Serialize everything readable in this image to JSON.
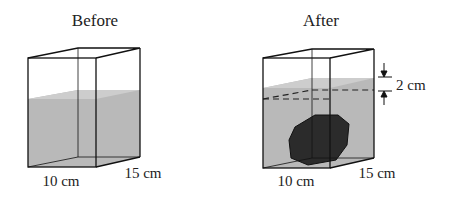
{
  "before": {
    "title": "Before",
    "width_label": "10 cm",
    "depth_label": "15 cm"
  },
  "after": {
    "title": "After",
    "width_label": "10 cm",
    "depth_label": "15 cm",
    "rise_label": "2 cm"
  },
  "colors": {
    "water": "#b8b8b8",
    "water_top": "#cfcfcf",
    "rock": "#2a2a2a",
    "edge": "#111111"
  }
}
